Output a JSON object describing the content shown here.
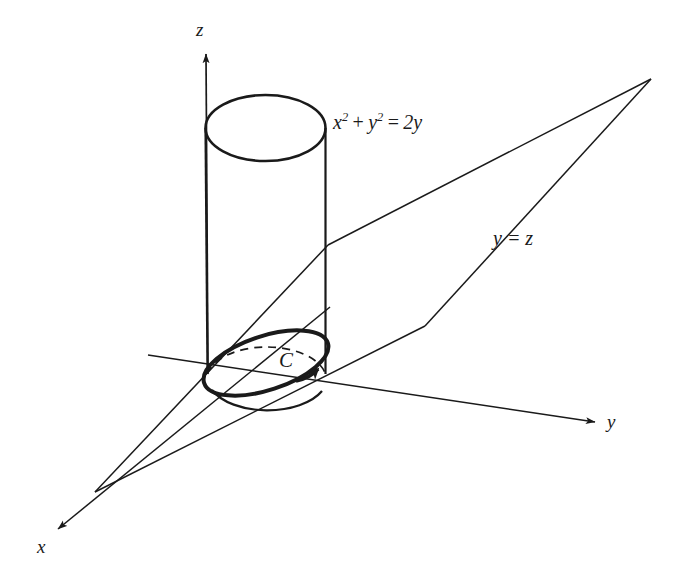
{
  "figure": {
    "background_color": "#ffffff",
    "stroke_color": "#1a1a1a",
    "axes": [
      {
        "name": "x",
        "label": "x",
        "label_x": 37,
        "label_y": 537,
        "direction": "down-left"
      },
      {
        "name": "y",
        "label": "y",
        "label_x": 607,
        "label_y": 412,
        "direction": "right"
      },
      {
        "name": "z",
        "label": "z",
        "label_x": 196,
        "label_y": 20,
        "direction": "up"
      }
    ],
    "cylinder": {
      "equation_parts": {
        "x": "x",
        "x_exp": "2",
        "plus": "+",
        "y": "y",
        "y_exp": "2",
        "equals": "=",
        "rhs": "2y"
      },
      "equation_text": "x2 + y2 = 2y",
      "label_x": 333,
      "label_y": 112
    },
    "plane": {
      "equation_text": "y = z",
      "label_x": 493,
      "label_y": 228
    },
    "curve": {
      "name": "C",
      "label": "C",
      "label_x": 279,
      "label_y": 350,
      "orientation": "counterclockwise-viewed-from-above"
    }
  }
}
